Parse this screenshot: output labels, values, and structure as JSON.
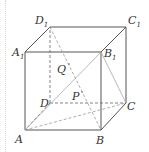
{
  "figure": {
    "type": "cube",
    "vertices": {
      "A": {
        "label": "A",
        "sub": "",
        "x": 25,
        "y": 130
      },
      "B": {
        "label": "B",
        "sub": "",
        "x": 101,
        "y": 130
      },
      "C": {
        "label": "C",
        "sub": "",
        "x": 126,
        "y": 103
      },
      "D": {
        "label": "D",
        "sub": "",
        "x": 50,
        "y": 103
      },
      "A1": {
        "label": "A",
        "sub": "1",
        "x": 25,
        "y": 52
      },
      "B1": {
        "label": "B",
        "sub": "1",
        "x": 101,
        "y": 52
      },
      "C1": {
        "label": "C",
        "sub": "1",
        "x": 126,
        "y": 27
      },
      "D1": {
        "label": "D",
        "sub": "1",
        "x": 50,
        "y": 27
      }
    },
    "points": {
      "P": {
        "label": "P",
        "x": 81,
        "y": 92
      },
      "Q": {
        "label": "Q",
        "x": 67,
        "y": 64
      }
    },
    "edges_solid": [
      "A-B",
      "B-C",
      "C-C1",
      "C1-D1",
      "D1-A1",
      "A1-A",
      "A1-B1",
      "B1-C1",
      "B1-B"
    ],
    "edges_hidden": [
      "D-A",
      "D-C",
      "D-D1"
    ],
    "segments_dashed": [
      "D1-B",
      "A-C"
    ],
    "segments_light": [
      "A-B1",
      "B1-C"
    ],
    "colors": {
      "edge": "#555555",
      "light": "#aaaaaa",
      "label": "#333333"
    }
  }
}
